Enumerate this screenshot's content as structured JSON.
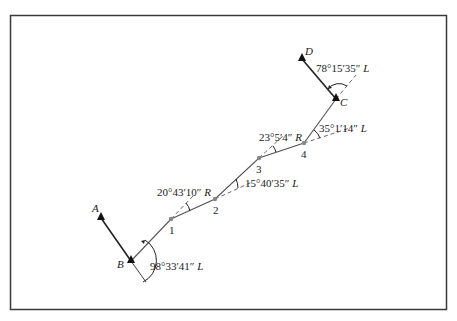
{
  "diagram": {
    "type": "traverse",
    "colors": {
      "frame": "#3a3a3a",
      "line": "#444444",
      "station": "#888888",
      "control": "#111111"
    },
    "control_points": [
      {
        "id": "A",
        "label": "A",
        "x": 101,
        "y": 218
      },
      {
        "id": "B",
        "label": "B",
        "x": 131,
        "y": 261
      },
      {
        "id": "C",
        "label": "C",
        "x": 336,
        "y": 99
      },
      {
        "id": "D",
        "label": "D",
        "x": 302,
        "y": 59
      }
    ],
    "stations": [
      {
        "id": "1",
        "label": "1",
        "x": 171,
        "y": 219
      },
      {
        "id": "2",
        "label": "2",
        "x": 215,
        "y": 199
      },
      {
        "id": "3",
        "label": "3",
        "x": 259,
        "y": 158
      },
      {
        "id": "4",
        "label": "4",
        "x": 304,
        "y": 143
      }
    ],
    "angles": [
      {
        "at": "B",
        "value": "98°33′41″",
        "dir": "L"
      },
      {
        "at": "1",
        "value": "20°43′10″",
        "dir": "R"
      },
      {
        "at": "2",
        "value": "15°40′35″",
        "dir": "L"
      },
      {
        "at": "3",
        "value": "23°5′4″",
        "dir": "R"
      },
      {
        "at": "4",
        "value": "35°1′14″",
        "dir": "L"
      },
      {
        "at": "C",
        "value": "78°15′35″",
        "dir": "L"
      }
    ]
  }
}
